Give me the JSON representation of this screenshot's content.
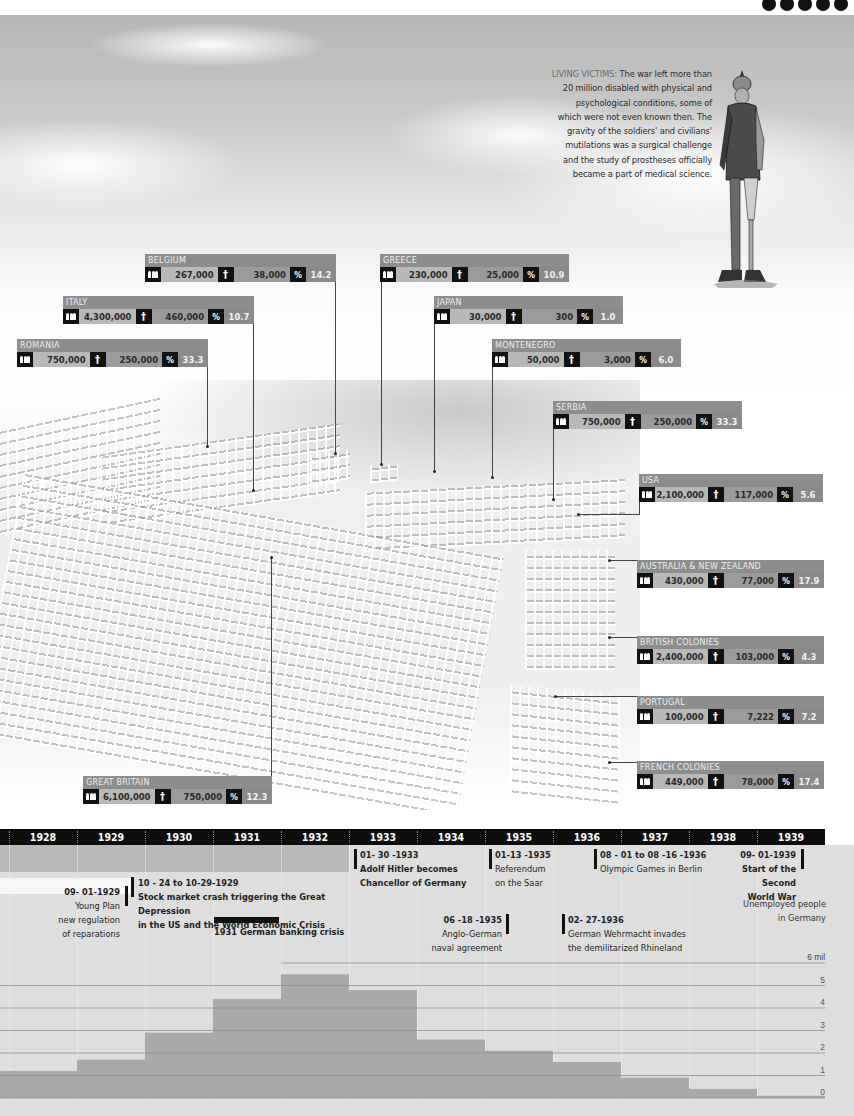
{
  "top_dots": 5,
  "caption": {
    "lead": "LIVING VICTIMS:",
    "text": "The war left more than 20 million disabled with physical and psychological conditions, some of which were not even known then. The gravity of the soldiers' and civilians' mutilations was a surgical challenge and the study of prostheses officially became a part of medical science."
  },
  "legend_icons": {
    "mobilized": "soldiers-icon",
    "deaths": "cross-icon",
    "percent": "percent-icon",
    "percent_symbol": "%",
    "cross_symbol": "†"
  },
  "countries": [
    {
      "name": "BELGIUM",
      "mobilized": "267,000",
      "deaths": "38,000",
      "percent": "14.2"
    },
    {
      "name": "ITALY",
      "mobilized": "4,300,000",
      "deaths": "460,000",
      "percent": "10.7"
    },
    {
      "name": "ROMANIA",
      "mobilized": "750,000",
      "deaths": "250,000",
      "percent": "33.3"
    },
    {
      "name": "GREECE",
      "mobilized": "230,000",
      "deaths": "25,000",
      "percent": "10.9"
    },
    {
      "name": "JAPAN",
      "mobilized": "30,000",
      "deaths": "300",
      "percent": "1.0"
    },
    {
      "name": "MONTENEGRO",
      "mobilized": "50,000",
      "deaths": "3,000",
      "percent": "6.0"
    },
    {
      "name": "SERBIA",
      "mobilized": "750,000",
      "deaths": "250,000",
      "percent": "33.3"
    },
    {
      "name": "USA",
      "mobilized": "2,100,000",
      "deaths": "117,000",
      "percent": "5.6"
    },
    {
      "name": "AUSTRALIA & NEW ZEALAND",
      "mobilized": "430,000",
      "deaths": "77,000",
      "percent": "17.9"
    },
    {
      "name": "BRITISH COLONIES",
      "mobilized": "2,400,000",
      "deaths": "103,000",
      "percent": "4.3"
    },
    {
      "name": "PORTUGAL",
      "mobilized": "100,000",
      "deaths": "7,222",
      "percent": "7.2"
    },
    {
      "name": "FRENCH COLONIES",
      "mobilized": "449,000",
      "deaths": "78,000",
      "percent": "17.4"
    },
    {
      "name": "GREAT BRITAIN",
      "mobilized": "6,100,000",
      "deaths": "750,000",
      "percent": "12.3"
    }
  ],
  "timeline": {
    "years": [
      "1928",
      "1929",
      "1930",
      "1931",
      "1932",
      "1933",
      "1934",
      "1935",
      "1936",
      "1937",
      "1938",
      "1939"
    ]
  },
  "events": {
    "young_plan": {
      "date": "09- 01-1929",
      "text": [
        "Young Plan",
        "new regulation",
        "of reparations"
      ]
    },
    "crash": {
      "date": "10 - 24  to 10-29-1929",
      "text": [
        "Stock market crash triggering the Great Depression",
        "in the US and the World Economic Crisis"
      ]
    },
    "banking": {
      "text": "1931 German banking crisis"
    },
    "hitler": {
      "date": "01- 30 -1933",
      "text": [
        "Adolf Hitler becomes",
        "Chancellor of Germany"
      ]
    },
    "naval": {
      "date": "06 -18 -1935",
      "text": [
        "Anglo-German",
        "naval agreement"
      ]
    },
    "saar": {
      "date": "01-13 -1935",
      "text": [
        "Referendum",
        "on the Saar"
      ]
    },
    "rhineland": {
      "date": "02- 27-1936",
      "text": [
        "German Wehrmacht invades",
        "the demilitarized Rhineland"
      ]
    },
    "olympics": {
      "date": "08 - 01 to 08 -16 -1936",
      "text": [
        "Olympic Games in Berlin"
      ]
    },
    "ww2": {
      "date": "09- 01-1939",
      "text": [
        "Start of the",
        "Second",
        "World War"
      ]
    }
  },
  "chart_data": {
    "type": "bar",
    "title": "Unemployed people in Germany",
    "unit_label": "6 mil",
    "xlabel": "",
    "ylabel": "Unemployed people in Germany (millions)",
    "categories": [
      "1928",
      "1929",
      "1930",
      "1931",
      "1932",
      "1933",
      "1934",
      "1935",
      "1936",
      "1937",
      "1938",
      "1939"
    ],
    "values": [
      1.2,
      1.7,
      2.9,
      4.4,
      5.5,
      4.8,
      2.6,
      2.1,
      1.6,
      0.9,
      0.4,
      0.1
    ],
    "ylim": [
      0,
      6
    ],
    "yticks": [
      "0",
      "1",
      "2",
      "3",
      "4",
      "5",
      "6 mil"
    ],
    "grid": true,
    "legend": "none"
  }
}
